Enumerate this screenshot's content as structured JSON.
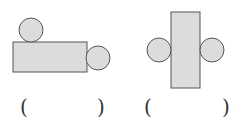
{
  "figures": [
    {
      "id": "figure-1",
      "rect": {
        "x": 13,
        "y": 42,
        "w": 74,
        "h": 30
      },
      "circles": [
        {
          "cx": 31,
          "cy": 30,
          "r": 12
        },
        {
          "cx": 98,
          "cy": 58,
          "r": 12
        }
      ],
      "answer": {
        "open": "(",
        "close": ")",
        "value": ""
      }
    },
    {
      "id": "figure-2",
      "rect": {
        "x": 171,
        "y": 12,
        "w": 29,
        "h": 76
      },
      "circles": [
        {
          "cx": 159,
          "cy": 50,
          "r": 12
        },
        {
          "cx": 212,
          "cy": 50,
          "r": 12
        }
      ],
      "answer": {
        "open": "(",
        "close": ")",
        "value": ""
      }
    }
  ],
  "colors": {
    "fill": "#dcdcdc",
    "stroke": "#555555",
    "background": "#ffffff"
  }
}
